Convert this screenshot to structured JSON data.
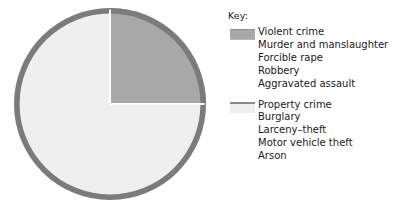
{
  "legend": {
    "title": "Key:",
    "groups": [
      {
        "swatch_name": "violent-crime-swatch",
        "color": "#a8a8a8",
        "items": [
          "Violent crime",
          "Murder and manslaughter",
          "Forcible rape",
          "Robbery",
          "Aggravated assault"
        ]
      },
      {
        "swatch_name": "property-crime-swatch",
        "color": "#eeeeee",
        "items": [
          "Property crime",
          "Burglary",
          "Larceny–theft",
          "Motor vehicle theft",
          "Arson"
        ]
      }
    ]
  },
  "chart_data": {
    "type": "pie",
    "title": "",
    "labels": [
      "Violent crime",
      "Property crime"
    ],
    "values": [
      25,
      75
    ],
    "units": "percent",
    "colors": [
      "#a8a8a8",
      "#efefef"
    ],
    "start_angle_deg": 0,
    "direction": "clockwise",
    "legend_position": "right",
    "grid": false,
    "annotations": [],
    "slices": [
      {
        "label": "Violent crime",
        "value": 25,
        "color": "#a8a8a8",
        "start_deg": 0,
        "end_deg": 90,
        "subcategories": [
          "Murder and manslaughter",
          "Forcible rape",
          "Robbery",
          "Aggravated assault"
        ]
      },
      {
        "label": "Property crime",
        "value": 75,
        "color": "#efefef",
        "start_deg": 90,
        "end_deg": 360,
        "subcategories": [
          "Burglary",
          "Larceny–theft",
          "Motor vehicle theft",
          "Arson"
        ]
      }
    ]
  },
  "style": {
    "ring_color": "#7b7b7b",
    "divider_color": "#ffffff",
    "background": "#ffffff"
  }
}
